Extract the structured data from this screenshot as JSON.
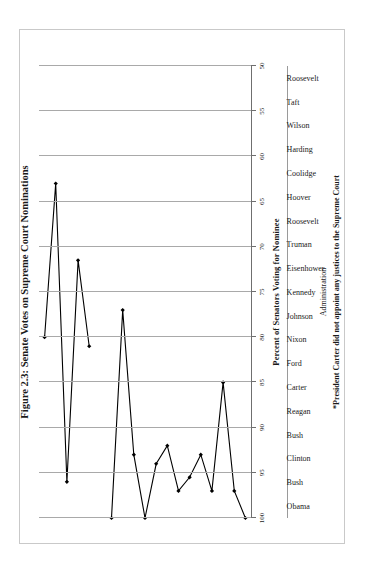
{
  "figure": {
    "title": "Figure 2.3: Senate Votes on Supreme Court Nominations",
    "y_axis_label": "Percent of Senators Voting for Nominee",
    "x_axis_label": "Administration",
    "footnote": "*President Carter did not appoint any justices to the Supreme Court",
    "frame_color": "#c9c9c9",
    "gridline_color": "#a9a9a9",
    "series_color": "#000000"
  },
  "chart_data": {
    "type": "line",
    "title": "Figure 2.3: Senate Votes on Supreme Court Nominations",
    "xlabel": "Administration",
    "ylabel": "Percent of Senators Voting for Nominee",
    "orientation": "rotated-90-portrait-page",
    "grid": true,
    "legend": "none",
    "ylim": [
      50,
      100
    ],
    "yticks": [
      100,
      95,
      90,
      85,
      80,
      75,
      70,
      65,
      60,
      55,
      50
    ],
    "ytick_labels": [
      "100",
      "95",
      "90",
      "85",
      "80",
      "75",
      "70",
      "65",
      "60",
      "55",
      "50"
    ],
    "categories": [
      "Roosevelt",
      "Taft",
      "Wilson",
      "Harding",
      "Coolidge",
      "Hoover",
      "Roosevelt",
      "Truman",
      "Eisenhower",
      "Kennedy",
      "Johnson",
      "Nixon",
      "Ford",
      "Carter",
      "Reagan",
      "Bush",
      "Clinton",
      "Bush",
      "Obama"
    ],
    "values": [
      100,
      97,
      85,
      97,
      93,
      95.5,
      97,
      92,
      94,
      100,
      93,
      77,
      100,
      null,
      81,
      71.5,
      96,
      63,
      80
    ],
    "annotations": [
      "*President Carter did not appoint any justices to the Supreme Court"
    ]
  }
}
